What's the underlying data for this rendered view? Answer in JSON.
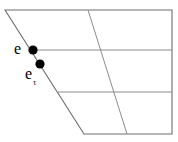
{
  "figure": {
    "type": "line-diagram",
    "width": 178,
    "height": 142,
    "background_color": "#ffffff",
    "stroke_color": "#808080",
    "outline_color": "#707070",
    "marker_color": "#000000",
    "text_color": "#000000"
  },
  "labels": {
    "upper_point": "e",
    "lower_point": "e",
    "lower_point_subscript": "τ"
  },
  "markers": [
    {
      "name": "point-e",
      "x": 33,
      "y": 50,
      "radius": 4.6,
      "color": "#000000"
    },
    {
      "name": "point-e-tau",
      "x": 40,
      "y": 64,
      "radius": 4.6,
      "color": "#000000"
    }
  ],
  "geometry": {
    "outline": [
      {
        "x": 5,
        "y": 10
      },
      {
        "x": 172,
        "y": 10
      },
      {
        "x": 172,
        "y": 134
      },
      {
        "x": 84,
        "y": 134
      }
    ],
    "grid_lines": [
      {
        "name": "horizontal-upper",
        "x1": 29,
        "y1": 50,
        "x2": 172,
        "y2": 50
      },
      {
        "name": "horizontal-lower",
        "x1": 58,
        "y1": 92,
        "x2": 172,
        "y2": 92
      },
      {
        "name": "slanted-interior",
        "x1": 88,
        "y1": 10,
        "x2": 127,
        "y2": 134
      }
    ]
  }
}
